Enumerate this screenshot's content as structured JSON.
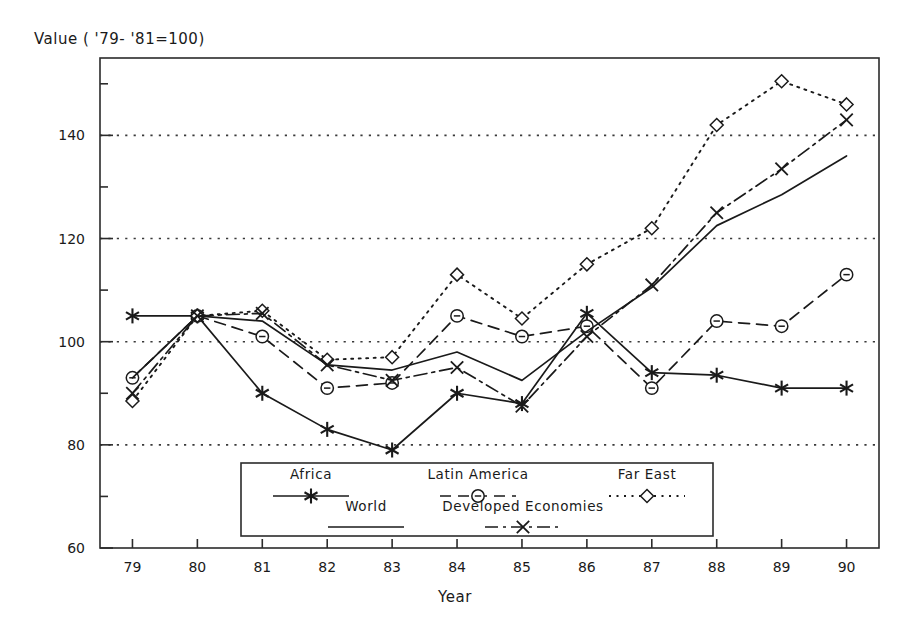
{
  "chart_data": {
    "type": "line",
    "title": "Value ( '79- '81=100)",
    "ylabel": "Value ( '79- '81=100)",
    "xlabel": "Year",
    "x": [
      79,
      80,
      81,
      82,
      83,
      84,
      85,
      86,
      87,
      88,
      89,
      90
    ],
    "xtick_labels": [
      "79",
      "80",
      "81",
      "82",
      "83",
      "84",
      "85",
      "86",
      "87",
      "88",
      "89",
      "90"
    ],
    "ylim": [
      60,
      155
    ],
    "xlim": [
      78.5,
      90.5
    ],
    "ytick_labels": [
      "60",
      "80",
      "100",
      "120",
      "140"
    ],
    "yticks": [
      60,
      80,
      100,
      120,
      140
    ],
    "yminor_ticks": [
      70,
      90,
      110,
      130,
      150
    ],
    "gridlines": [
      80,
      100,
      120,
      140
    ],
    "grid": "horizontal-dotted",
    "legend_position": "inside-bottom-center",
    "series": [
      {
        "name": "Africa",
        "style": "solid",
        "marker": "asterisk",
        "values": [
          105,
          105,
          90,
          83,
          79,
          90,
          88,
          105.5,
          94,
          93.5,
          91,
          91
        ]
      },
      {
        "name": "Latin America",
        "style": "dashed",
        "marker": "circle-dash",
        "values": [
          93,
          105,
          101,
          91,
          92,
          105,
          101,
          103,
          91,
          104,
          103,
          113
        ]
      },
      {
        "name": "Far East",
        "style": "dotted",
        "marker": "diamond",
        "values": [
          88.5,
          105,
          106,
          96.5,
          97,
          113,
          104.5,
          115,
          122,
          142,
          150.5,
          146
        ]
      },
      {
        "name": "World",
        "style": "solid-plain",
        "marker": "none",
        "values": [
          93,
          105,
          104,
          95.5,
          94.5,
          98,
          92.5,
          102,
          110.5,
          122.5,
          128.5,
          136
        ]
      },
      {
        "name": "Developed Economies",
        "style": "dash-dot",
        "marker": "x",
        "values": [
          90,
          105,
          105.5,
          95.5,
          92.5,
          95,
          87.5,
          101,
          111,
          125,
          133.5,
          143
        ]
      }
    ]
  },
  "legend": {
    "entries": [
      {
        "label": "Africa",
        "marker": "asterisk",
        "style": "solid"
      },
      {
        "label": "Latin America",
        "marker": "circle-dash",
        "style": "dashed"
      },
      {
        "label": "Far East",
        "marker": "diamond",
        "style": "dotted"
      },
      {
        "label": "World",
        "marker": "none",
        "style": "solid-plain"
      },
      {
        "label": "Developed Economies",
        "marker": "x",
        "style": "dash-dot"
      }
    ]
  },
  "colors": {
    "ink": "#1a1a1a",
    "frame": "#2b2b2b",
    "grid": "#3a3a3a",
    "background": "#ffffff"
  }
}
